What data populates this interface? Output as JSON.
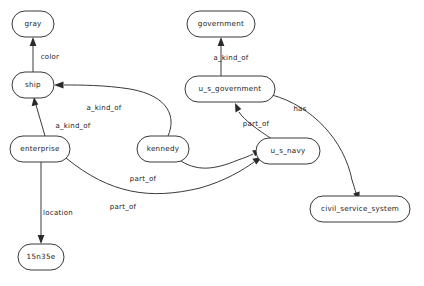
{
  "diagram": {
    "type": "semantic-network",
    "title": "",
    "background_color": "#ffffff",
    "node_fill_color": "#ffffff",
    "node_stroke_color": "#3a3a3a",
    "edge_color": "#3a3a3a",
    "text_color": "#1a1a1a",
    "nodes": [
      {
        "id": "gray",
        "label": "gray",
        "cx": 33,
        "cy": 24,
        "rx": 21,
        "ry": 13
      },
      {
        "id": "government",
        "label": "government",
        "cx": 221,
        "cy": 24,
        "rx": 34,
        "ry": 13
      },
      {
        "id": "ship",
        "label": "ship",
        "cx": 33,
        "cy": 85,
        "rx": 21,
        "ry": 13
      },
      {
        "id": "u_s_government",
        "label": "u_s_government",
        "cx": 230,
        "cy": 89,
        "rx": 45,
        "ry": 13
      },
      {
        "id": "enterprise",
        "label": "enterprise",
        "cx": 40,
        "cy": 149,
        "rx": 30,
        "ry": 13
      },
      {
        "id": "kennedy",
        "label": "kennedy",
        "cx": 163,
        "cy": 149,
        "rx": 26,
        "ry": 13
      },
      {
        "id": "u_s_navy",
        "label": "u_s_navy",
        "cx": 288,
        "cy": 151,
        "rx": 32,
        "ry": 13
      },
      {
        "id": "civil_service_system",
        "label": "civil_service_system",
        "cx": 360,
        "cy": 209,
        "rx": 50,
        "ry": 13
      },
      {
        "id": "15n35e",
        "label": "15n35e",
        "cx": 41,
        "cy": 257,
        "rx": 23,
        "ry": 13
      }
    ],
    "edges": [
      {
        "id": "ship-color-gray",
        "from": "ship",
        "to": "gray",
        "label": "color",
        "label_x": 50,
        "label_y": 57
      },
      {
        "id": "enterprise-akindof-ship",
        "from": "enterprise",
        "to": "ship",
        "label": "a_kind_of",
        "label_x": 73,
        "label_y": 126
      },
      {
        "id": "kennedy-akindof-ship",
        "from": "kennedy",
        "to": "ship",
        "label": "a_kind_of",
        "label_x": 104,
        "label_y": 108
      },
      {
        "id": "usgovernment-akindof-government",
        "from": "u_s_government",
        "to": "government",
        "label": "a_kind_of",
        "label_x": 231,
        "label_y": 58
      },
      {
        "id": "usnavy-partof-usgovernment",
        "from": "u_s_navy",
        "to": "u_s_government",
        "label": "part_of",
        "label_x": 256,
        "label_y": 124
      },
      {
        "id": "kennedy-partof-usnavy",
        "from": "kennedy",
        "to": "u_s_navy",
        "label": "part_of",
        "label_x": 143,
        "label_y": 179
      },
      {
        "id": "enterprise-partof-usnavy",
        "from": "enterprise",
        "to": "u_s_navy",
        "label": "part_of",
        "label_x": 123,
        "label_y": 207
      },
      {
        "id": "usgovernment-has-civilservice",
        "from": "u_s_government",
        "to": "civil_service_system",
        "label": "has",
        "label_x": 300,
        "label_y": 109
      },
      {
        "id": "enterprise-location-15n35e",
        "from": "enterprise",
        "to": "15n35e",
        "label": "location",
        "label_x": 58,
        "label_y": 213
      }
    ]
  }
}
